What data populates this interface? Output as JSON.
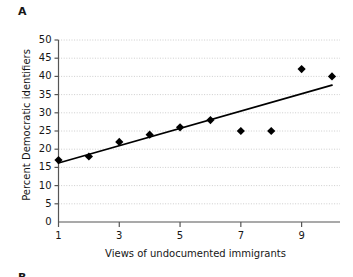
{
  "figure": {
    "panel_label": "A",
    "next_panel_label": "B"
  },
  "chart_data": {
    "type": "scatter",
    "title": "",
    "xlabel": "Views of undocumented immigrants",
    "ylabel": "Percent Democratic identifiers",
    "xlim": [
      1,
      10
    ],
    "ylim": [
      0,
      50
    ],
    "grid": true,
    "legend": "none",
    "x_ticks": [
      1,
      3,
      5,
      7,
      9
    ],
    "x_tick_labels": [
      "1",
      "3",
      "5",
      "7",
      "9"
    ],
    "y_ticks": [
      0,
      5,
      10,
      15,
      20,
      25,
      30,
      35,
      40,
      45,
      50
    ],
    "y_tick_labels": [
      "0",
      "5",
      "10",
      "15",
      "20",
      "25",
      "30",
      "35",
      "40",
      "45",
      "50"
    ],
    "x": [
      1,
      2,
      3,
      4,
      5,
      6,
      7,
      8,
      9,
      10
    ],
    "values": [
      17,
      18,
      22,
      24,
      26,
      28,
      25,
      25,
      42,
      40
    ],
    "series": [
      {
        "name": "Percent Democratic identifiers",
        "marker": "diamond",
        "color": "#000000",
        "points": [
          {
            "x": 1,
            "y": 17
          },
          {
            "x": 2,
            "y": 18
          },
          {
            "x": 3,
            "y": 22
          },
          {
            "x": 4,
            "y": 24
          },
          {
            "x": 5,
            "y": 26
          },
          {
            "x": 6,
            "y": 28
          },
          {
            "x": 7,
            "y": 25
          },
          {
            "x": 8,
            "y": 25
          },
          {
            "x": 9,
            "y": 42
          },
          {
            "x": 10,
            "y": 40
          }
        ]
      }
    ],
    "trendline": {
      "name": "linear fit",
      "color": "#000000",
      "x_start": 1,
      "y_start": 16.2,
      "x_end": 10,
      "y_end": 37.6
    }
  }
}
